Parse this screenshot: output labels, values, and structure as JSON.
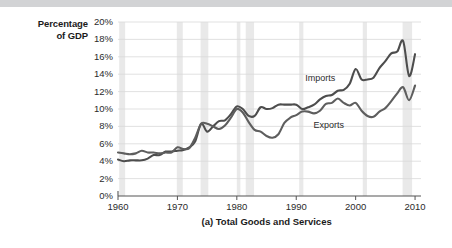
{
  "axis_title": {
    "line1": "Percentage",
    "line2": "of GDP"
  },
  "caption": "(a) Total Goods and Services",
  "colors": {
    "imports_line": "#4d4d4d",
    "exports_line": "#5e5e5e",
    "gridline": "#d9d9d9",
    "recession_band": "#e9e9e9",
    "axis": "#555555",
    "top_band": "#d2d3d5",
    "text": "#2b2b2b"
  },
  "chart_data": {
    "type": "line",
    "title": "(a) Total Goods and Services",
    "xlabel": "",
    "ylabel": "Percentage of GDP",
    "xlim": [
      1960,
      2011
    ],
    "ylim": [
      0,
      20
    ],
    "grid": true,
    "legend_position": "inline-annotation",
    "y_ticks": [
      "0%",
      "2%",
      "4%",
      "6%",
      "8%",
      "10%",
      "12%",
      "14%",
      "16%",
      "18%",
      "20%"
    ],
    "y_tick_values": [
      0,
      2,
      4,
      6,
      8,
      10,
      12,
      14,
      16,
      18,
      20
    ],
    "x_ticks": [
      "1960",
      "1970",
      "1980",
      "1990",
      "2000",
      "2010"
    ],
    "x_tick_values": [
      1960,
      1970,
      1980,
      1990,
      2000,
      2010
    ],
    "recession_bands": [
      [
        1960.2,
        1961.2
      ],
      [
        1969.9,
        1970.9
      ],
      [
        1973.9,
        1975.2
      ],
      [
        1980.0,
        1980.6
      ],
      [
        1981.5,
        1982.9
      ],
      [
        1990.5,
        1991.2
      ],
      [
        2001.2,
        2001.9
      ],
      [
        2007.9,
        2009.5
      ]
    ],
    "x": [
      1960,
      1961,
      1962,
      1963,
      1964,
      1965,
      1966,
      1967,
      1968,
      1969,
      1970,
      1971,
      1972,
      1973,
      1974,
      1975,
      1976,
      1977,
      1978,
      1979,
      1980,
      1981,
      1982,
      1983,
      1984,
      1985,
      1986,
      1987,
      1988,
      1989,
      1990,
      1991,
      1992,
      1993,
      1994,
      1995,
      1996,
      1997,
      1998,
      1999,
      2000,
      2001,
      2002,
      2003,
      2004,
      2005,
      2006,
      2007,
      2008,
      2009,
      2010
    ],
    "series": [
      {
        "name": "Imports",
        "values": [
          4.2,
          4.0,
          4.1,
          4.1,
          4.1,
          4.3,
          4.7,
          4.7,
          5.1,
          5.1,
          5.2,
          5.3,
          5.6,
          6.3,
          8.3,
          7.4,
          8.0,
          8.6,
          8.7,
          9.4,
          10.3,
          10.0,
          9.2,
          9.2,
          10.2,
          10.0,
          10.1,
          10.5,
          10.5,
          10.5,
          10.5,
          10.0,
          10.2,
          10.5,
          11.1,
          11.5,
          11.6,
          12.1,
          12.2,
          12.9,
          14.6,
          13.4,
          13.4,
          13.6,
          14.7,
          15.5,
          16.4,
          16.6,
          17.8,
          13.8,
          16.3
        ]
      },
      {
        "name": "Exports",
        "values": [
          5.0,
          4.9,
          4.8,
          4.9,
          5.2,
          5.0,
          5.0,
          4.9,
          5.0,
          5.0,
          5.6,
          5.4,
          5.5,
          6.7,
          8.3,
          8.3,
          8.0,
          7.7,
          8.1,
          9.0,
          10.0,
          9.6,
          8.5,
          7.6,
          7.4,
          6.9,
          6.7,
          7.1,
          8.4,
          9.0,
          9.3,
          9.7,
          9.7,
          9.5,
          9.8,
          10.6,
          10.7,
          11.2,
          10.7,
          10.4,
          10.7,
          9.8,
          9.2,
          9.1,
          9.7,
          10.1,
          10.9,
          11.8,
          12.5,
          11.0,
          12.7
        ]
      }
    ],
    "annotations": [
      {
        "text": "Imports",
        "x": 1991.5,
        "y": 13.6
      },
      {
        "text": "Exports",
        "x": 1992.9,
        "y": 8.2
      }
    ]
  }
}
